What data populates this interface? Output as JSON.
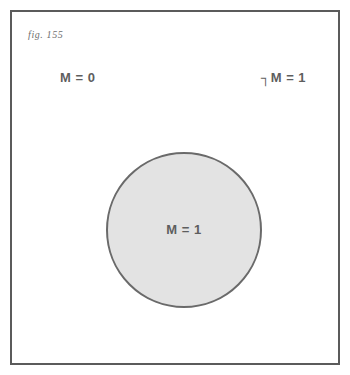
{
  "figure": {
    "caption": "fig. 155",
    "frame_color": "#5b5b5b",
    "background_color": "#ffffff"
  },
  "diagram": {
    "type": "venn-single-set",
    "outside_region": {
      "left_label": "M = 0",
      "right_label": "┐M = 1"
    },
    "circle": {
      "label": "M = 1",
      "fill_color": "#e3e3e3",
      "stroke_color": "#6a6a6a",
      "center_x": 172,
      "center_y": 218,
      "diameter": 156
    }
  }
}
